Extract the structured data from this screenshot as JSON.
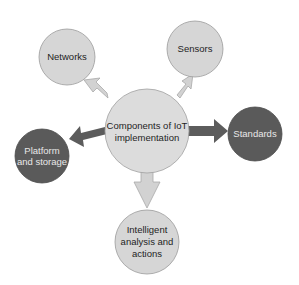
{
  "diagram": {
    "type": "hub-and-spoke",
    "colors": {
      "light_fill": "#d6d6d6",
      "light_stroke": "#9a9a9a",
      "dark_fill": "#5a5a5a",
      "dark_stroke": "#4a4a4a",
      "light_arrow": "#d2d2d2",
      "dark_arrow": "#5c5c5c"
    },
    "center": {
      "line1": "Components of IoT",
      "line2": "implementation"
    },
    "nodes": [
      {
        "id": "networks",
        "lines": [
          "Networks"
        ],
        "style": "light"
      },
      {
        "id": "sensors",
        "lines": [
          "Sensors"
        ],
        "style": "light"
      },
      {
        "id": "standards",
        "lines": [
          "Standards"
        ],
        "style": "dark"
      },
      {
        "id": "platform",
        "lines": [
          "Platform",
          "and storage"
        ],
        "style": "dark"
      },
      {
        "id": "intelligent",
        "lines": [
          "Intelligent",
          "analysis and",
          "actions"
        ],
        "style": "light"
      }
    ]
  }
}
